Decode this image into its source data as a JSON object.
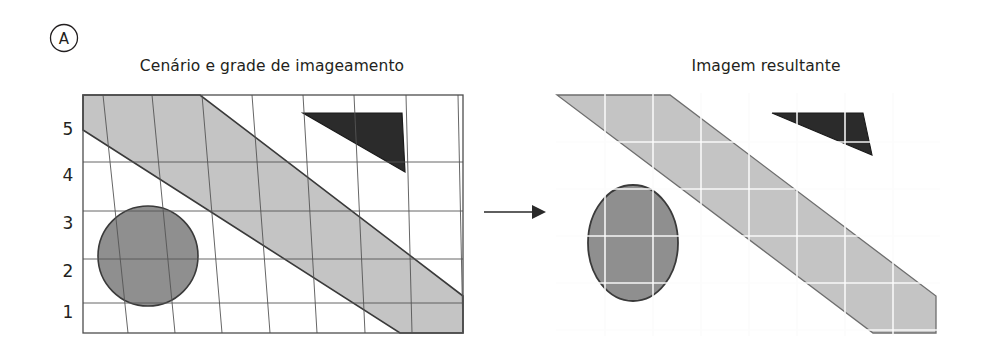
{
  "figure": {
    "panel_letter": "A",
    "background_color": "#ffffff",
    "width": 986,
    "height": 362
  },
  "left_panel": {
    "title": "Cenário e grade de imageamento",
    "axis_labels": [
      "5",
      "4",
      "3",
      "2",
      "1"
    ],
    "frame": {
      "x": 83,
      "y": 95,
      "width": 380,
      "height": 238
    },
    "frame_color": "#4d4d4d",
    "grid": {
      "horizontal_rows": 5,
      "slanted_columns": 8,
      "line_color": "#555555"
    },
    "shapes": [
      {
        "name": "swath-band",
        "type": "parallelogram-band",
        "fill": "#c4c4c4",
        "stroke": "#3a3a3a",
        "label": "faixa de imageamento"
      },
      {
        "name": "circle-feature",
        "type": "circle",
        "fill": "#8f8f8f",
        "stroke": "#3a3a3a",
        "cx": 148,
        "cy": 256,
        "r": 50
      },
      {
        "name": "triangle-feature",
        "type": "triangle",
        "fill": "#2b2b2b",
        "stroke": "#1a1a1a"
      }
    ]
  },
  "arrow": {
    "name": "transform-arrow",
    "color": "#2a2a2a",
    "x_start": 484,
    "x_end": 544,
    "y": 212
  },
  "right_panel": {
    "title": "Imagem resultante",
    "grid": {
      "line_color": "#ffffff",
      "columns": 7,
      "rows": 5,
      "cell_width": 48,
      "cell_height": 47
    },
    "shapes": [
      {
        "name": "swath-band",
        "type": "parallelogram-band",
        "fill": "#c4c4c4",
        "stroke": "#6e6e6e"
      },
      {
        "name": "ellipse-feature",
        "type": "ellipse",
        "fill": "#8f8f8f",
        "stroke": "#3a3a3a",
        "cx": 633,
        "cy": 243,
        "rx": 45,
        "ry": 58
      },
      {
        "name": "triangle-feature",
        "type": "triangle",
        "fill": "#2b2b2b",
        "stroke": "#1a1a1a"
      }
    ]
  }
}
